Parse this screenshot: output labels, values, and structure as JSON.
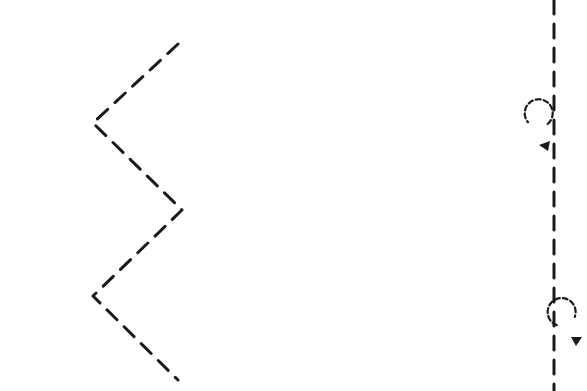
{
  "diagram": {
    "background": "#ffffff",
    "stroke_color": "#1a1a1a",
    "zigzag_path": {
      "points": "178,44 93,123 182,210 93,296 178,380",
      "dash": "14 10"
    },
    "vertical_line": {
      "x": 554,
      "y1": 0,
      "y2": 391,
      "dash": "14 10"
    },
    "loops": [
      {
        "name": "loop-left-of-line",
        "cx": 537,
        "cy": 133,
        "r": 14,
        "side": "left",
        "arrow_points": "539,145 550,141 548,151"
      },
      {
        "name": "loop-right-of-line",
        "cx": 570,
        "cy": 330,
        "r": 14,
        "side": "right",
        "arrow_points": "571,337 582,337 576,346"
      }
    ]
  }
}
